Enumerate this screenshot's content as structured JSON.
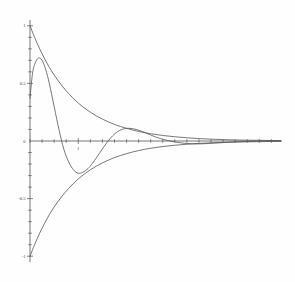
{
  "chart_data": {
    "type": "line",
    "title": "",
    "subtitle": "",
    "xlabel": "",
    "ylabel": "",
    "xlim": [
      0,
      10.4
    ],
    "ylim": [
      -1.05,
      1.05
    ],
    "grid": false,
    "legend": "none",
    "axis_style": "centered-cross",
    "y_ticks": [
      {
        "value": 1,
        "label": "1"
      },
      {
        "value": 0.5,
        "label": "0.5"
      },
      {
        "value": 0,
        "label": "0"
      },
      {
        "value": -0.5,
        "label": "-0.5"
      },
      {
        "value": -1,
        "label": "-1"
      }
    ],
    "y_minor_tick_step": 0.1,
    "x_ticks": [
      {
        "value": 2,
        "label": "1"
      }
    ],
    "x_minor_tick_step": 0.5,
    "annotations": [],
    "series": [
      {
        "name": "upper-envelope",
        "description": "exponential decay envelope from (0,1) to 0",
        "x": [
          0,
          0.2,
          0.4,
          0.6,
          0.8,
          1.0,
          1.3,
          1.6,
          2.0,
          2.5,
          3.0,
          3.5,
          4.0,
          4.5,
          5.0,
          5.5,
          6.0,
          6.5,
          7.0,
          7.5,
          8.0,
          8.5,
          9.0,
          9.5,
          10.0,
          10.4
        ],
        "values": [
          1.0,
          0.895,
          0.8,
          0.716,
          0.64,
          0.573,
          0.486,
          0.412,
          0.329,
          0.25,
          0.19,
          0.144,
          0.11,
          0.083,
          0.063,
          0.048,
          0.037,
          0.028,
          0.021,
          0.016,
          0.012,
          0.009,
          0.007,
          0.006,
          0.004,
          0.003
        ]
      },
      {
        "name": "lower-envelope",
        "description": "negative exponential decay envelope from (0,-1) to 0",
        "x": [
          0,
          0.2,
          0.4,
          0.6,
          0.8,
          1.0,
          1.3,
          1.6,
          2.0,
          2.5,
          3.0,
          3.5,
          4.0,
          4.5,
          5.0,
          5.5,
          6.0,
          6.5,
          7.0,
          7.5,
          8.0,
          8.5,
          9.0,
          9.5,
          10.0,
          10.4
        ],
        "values": [
          -1.0,
          -0.895,
          -0.8,
          -0.716,
          -0.64,
          -0.573,
          -0.486,
          -0.412,
          -0.329,
          -0.25,
          -0.19,
          -0.144,
          -0.11,
          -0.083,
          -0.063,
          -0.048,
          -0.037,
          -0.028,
          -0.021,
          -0.016,
          -0.012,
          -0.009,
          -0.007,
          -0.006,
          -0.004,
          -0.003
        ]
      },
      {
        "name": "damped-oscillation",
        "description": "damped oscillating curve starting near 0.37, peaking 0.72, dipping to -0.28, small rebound 0.11",
        "x": [
          0,
          0.1,
          0.2,
          0.35,
          0.5,
          0.65,
          0.8,
          1.0,
          1.2,
          1.4,
          1.6,
          1.8,
          2.0,
          2.2,
          2.4,
          2.6,
          2.9,
          3.2,
          3.5,
          3.8,
          4.1,
          4.4,
          4.8,
          5.2,
          5.6,
          6.0,
          6.5,
          7.0,
          7.5,
          8.0,
          8.6,
          9.2,
          9.8,
          10.4
        ],
        "values": [
          0.37,
          0.58,
          0.67,
          0.72,
          0.7,
          0.62,
          0.5,
          0.3,
          0.1,
          -0.07,
          -0.18,
          -0.25,
          -0.28,
          -0.27,
          -0.24,
          -0.19,
          -0.1,
          -0.01,
          0.06,
          0.1,
          0.11,
          0.1,
          0.07,
          0.035,
          0.01,
          -0.008,
          -0.022,
          -0.025,
          -0.02,
          -0.014,
          -0.007,
          -0.002,
          0.001,
          0.002
        ]
      }
    ],
    "colors": {
      "curve": "#555555",
      "axis": "#555555",
      "tick_label": "#4a4a4a",
      "background": "#fefefe"
    }
  }
}
